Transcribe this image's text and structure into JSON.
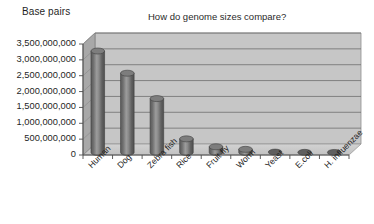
{
  "chart_data": {
    "type": "bar",
    "title": "How do genome sizes compare?",
    "xlabel": "",
    "ylabel": "Base pairs",
    "categories": [
      "Human",
      "Dog",
      "Zebra fish",
      "Rice",
      "Fruit fly",
      "Worm",
      "Yeast",
      "E.coli",
      "H. influenzae"
    ],
    "values": [
      3200000000,
      2500000000,
      1700000000,
      430000000,
      180000000,
      100000000,
      12000000,
      4600000,
      1800000
    ],
    "series": [
      {
        "name": "Base pairs",
        "values": [
          3200000000,
          2500000000,
          1700000000,
          430000000,
          180000000,
          100000000,
          12000000,
          4600000,
          1800000
        ]
      }
    ],
    "ylim": [
      0,
      3500000000
    ],
    "ytick_values": [
      0,
      500000000,
      1000000000,
      1500000000,
      2000000000,
      2500000000,
      3000000000,
      3500000000
    ],
    "ytick_labels": [
      "3,500,000,000",
      "3,000,000,000",
      "2,500,000,000",
      "2,000,000,000",
      "1,500,000,000",
      "1,000,000,000",
      "500,000,000",
      "0"
    ],
    "grid": true,
    "legend": false,
    "legend_position": "none",
    "style": "3d-cylinder",
    "bar_color": "#6e6e6e",
    "plot_background": "#c8c8c8",
    "wall_color": "#bdbdbd",
    "gridline_color": "#6b6b6b"
  },
  "colors": {
    "bar_fill": "#6e6e6e",
    "bar_highlight": "#9a9a9a",
    "bar_shadow": "#4a4a4a",
    "plot_floor": "#cfcfcf",
    "plot_wall": "#c6c6c6",
    "plot_side_wall": "#a8a8a8",
    "grid": "#6f6f6f",
    "axis": "#4d4d4d",
    "text": "#1f1f1f"
  }
}
